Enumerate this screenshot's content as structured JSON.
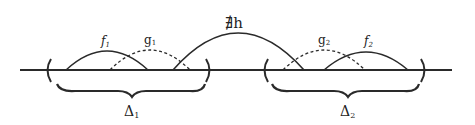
{
  "diagram": {
    "colors": {
      "ink": "#2a2a2a",
      "background": "#ffffff"
    },
    "labels": {
      "f1": "f",
      "f1_sub": "1",
      "g1": "g",
      "g1_sub": "1",
      "h": "∄h",
      "g2": "g",
      "g2_sub": "2",
      "f2": "f",
      "f2_sub": "2",
      "delta1": "Δ",
      "delta1_sub": "1",
      "delta2": "Δ",
      "delta2_sub": "2"
    },
    "arcs": [
      {
        "name": "f1",
        "style": "solid"
      },
      {
        "name": "g1",
        "style": "dashed"
      },
      {
        "name": "h",
        "style": "solid"
      },
      {
        "name": "g2",
        "style": "dashed"
      },
      {
        "name": "f2",
        "style": "solid"
      }
    ],
    "intervals": [
      "Δ1",
      "Δ2"
    ]
  }
}
